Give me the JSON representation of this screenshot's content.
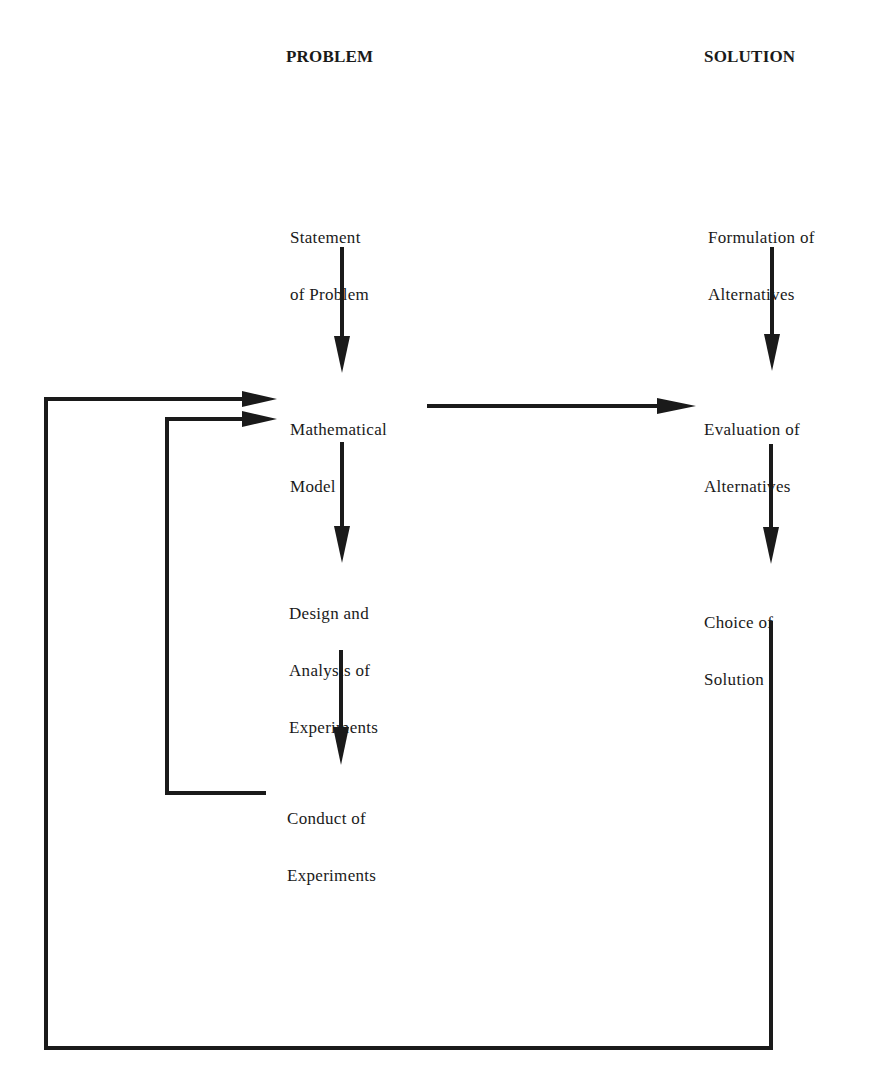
{
  "headings": {
    "problem": "PROBLEM",
    "solution": "SOLUTION"
  },
  "nodes": {
    "statement_of_problem": {
      "line1": "Statement",
      "line2": "of Problem"
    },
    "mathematical_model": {
      "line1": "Mathematical",
      "line2": "Model"
    },
    "design_and_analysis": {
      "line1": "Design and",
      "line2": "Analysis of",
      "line3": "Experiments"
    },
    "conduct_of_experiments": {
      "line1": "Conduct of",
      "line2": "Experiments"
    },
    "formulation_of_alternatives": {
      "line1": "Formulation of",
      "line2": "Alternatives"
    },
    "evaluation_of_alternatives": {
      "line1": "Evaluation of",
      "line2": "Alternatives"
    },
    "choice_of_solution": {
      "line1": "Choice of",
      "line2": "Solution"
    }
  },
  "edges": [
    {
      "from": "Statement of Problem",
      "to": "Mathematical Model"
    },
    {
      "from": "Mathematical Model",
      "to": "Design and Analysis of Experiments"
    },
    {
      "from": "Design and Analysis of Experiments",
      "to": "Conduct of Experiments"
    },
    {
      "from": "Conduct of Experiments",
      "to": "Mathematical Model",
      "type": "feedback"
    },
    {
      "from": "Mathematical Model",
      "to": "Evaluation of Alternatives"
    },
    {
      "from": "Formulation of Alternatives",
      "to": "Evaluation of Alternatives"
    },
    {
      "from": "Evaluation of Alternatives",
      "to": "Choice of Solution"
    },
    {
      "from": "Choice of Solution",
      "to": "Mathematical Model",
      "type": "feedback"
    }
  ],
  "colors": {
    "ink": "#1a1a1a",
    "background": "#ffffff"
  }
}
